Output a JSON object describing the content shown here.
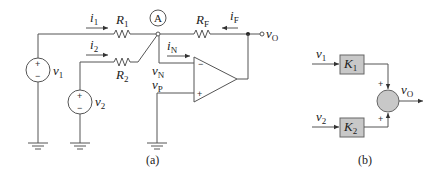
{
  "figure_a": {
    "caption": "(a)",
    "node_label": "A",
    "currents": {
      "i1": {
        "base": "i",
        "sub": "1"
      },
      "i2": {
        "base": "i",
        "sub": "2"
      },
      "iN": {
        "base": "i",
        "sub": "N"
      },
      "iF": {
        "base": "i",
        "sub": "F"
      }
    },
    "resistors": {
      "R1": {
        "base": "R",
        "sub": "1"
      },
      "R2": {
        "base": "R",
        "sub": "2"
      },
      "RF": {
        "base": "R",
        "sub": "F"
      }
    },
    "sources": {
      "v1": {
        "base": "v",
        "sub": "1"
      },
      "v2": {
        "base": "v",
        "sub": "2"
      }
    },
    "node_voltages": {
      "vN": {
        "base": "v",
        "sub": "N"
      },
      "vP": {
        "base": "v",
        "sub": "P"
      },
      "vO": {
        "base": "v",
        "sub": "O"
      }
    },
    "opamp_signs": {
      "minus": "−",
      "plus": "+"
    },
    "source_signs": {
      "plus": "+",
      "minus": "−"
    }
  },
  "figure_b": {
    "caption": "(b)",
    "inputs": {
      "v1": {
        "base": "v",
        "sub": "1"
      },
      "v2": {
        "base": "v",
        "sub": "2"
      }
    },
    "blocks": {
      "K1": {
        "base": "K",
        "sub": "1"
      },
      "K2": {
        "base": "K",
        "sub": "2"
      }
    },
    "output": {
      "base": "v",
      "sub": "O"
    },
    "summer_signs": [
      "+",
      "+"
    ],
    "block_fill": "#c8c8c8",
    "summer_fill": "#c8c8c8"
  }
}
